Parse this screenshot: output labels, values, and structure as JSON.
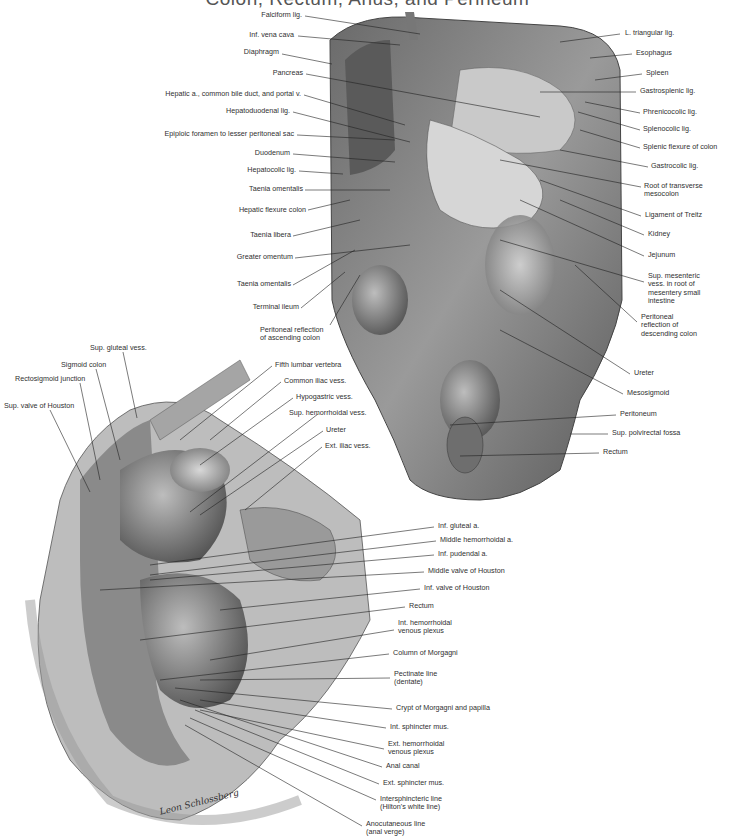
{
  "title": "Colon, Rectum, Anus, and Perineum",
  "upper_figure": {
    "left_labels": [
      {
        "text": "Falciform lig.",
        "x": 255,
        "y": 13
      },
      {
        "text": "Inf. vena cava",
        "x": 245,
        "y": 33
      },
      {
        "text": "Diaphragm",
        "x": 240,
        "y": 50
      },
      {
        "text": "Pancreas",
        "x": 274,
        "y": 71
      },
      {
        "text": "Hepatic a., common bile duct, and portal v.",
        "x": 298,
        "y": 92
      },
      {
        "text": "Hepatoduodenal lig.",
        "x": 290,
        "y": 109
      },
      {
        "text": "Epiploic foramen to lesser peritoneal sac",
        "x": 292,
        "y": 132
      },
      {
        "text": "Duodenum",
        "x": 288,
        "y": 151
      },
      {
        "text": "Hepatocolic lig.",
        "x": 294,
        "y": 168
      },
      {
        "text": "Taenia omentalis",
        "x": 302,
        "y": 187
      },
      {
        "text": "Hepatic flexure colon",
        "x": 305,
        "y": 208
      },
      {
        "text": "Taenia libera",
        "x": 290,
        "y": 233
      },
      {
        "text": "Greater omentum",
        "x": 292,
        "y": 255
      },
      {
        "text": "Taenia omentalis",
        "x": 290,
        "y": 282
      },
      {
        "text": "Terminal ileum",
        "x": 298,
        "y": 305
      }
    ],
    "left_multiline": {
      "lines": [
        "Peritoneal reflection",
        "of ascending colon"
      ],
      "x": 260,
      "y": 327
    },
    "right_labels": [
      {
        "text": "L. triangular lig.",
        "x": 625,
        "y": 31
      },
      {
        "text": "Esophagus",
        "x": 636,
        "y": 51
      },
      {
        "text": "Spleen",
        "x": 646,
        "y": 71
      },
      {
        "text": "Gastrosplenic lig.",
        "x": 640,
        "y": 89
      },
      {
        "text": "Phrenicocolic lig.",
        "x": 643,
        "y": 110
      },
      {
        "text": "Splenocolic lig.",
        "x": 643,
        "y": 127
      },
      {
        "text": "Splenic flexure of colon",
        "x": 643,
        "y": 145
      },
      {
        "text": "Gastrocolic lig.",
        "x": 651,
        "y": 164
      },
      {
        "text": "Ligament of Treitz",
        "x": 645,
        "y": 213
      },
      {
        "text": "Kidney",
        "x": 648,
        "y": 232
      },
      {
        "text": "Jejunum",
        "x": 648,
        "y": 253
      },
      {
        "text": "Ureter",
        "x": 634,
        "y": 371
      },
      {
        "text": "Mesosigmoid",
        "x": 627,
        "y": 391
      },
      {
        "text": "Peritoneum",
        "x": 620,
        "y": 412
      },
      {
        "text": "Sup. polvirectal fossa",
        "x": 612,
        "y": 431
      },
      {
        "text": "Rectum",
        "x": 603,
        "y": 450
      }
    ],
    "right_multiline": [
      {
        "lines": [
          "Root of transverse",
          "mesocolon"
        ],
        "x": 644,
        "y": 184
      },
      {
        "lines": [
          "Sup. mesenteric",
          "vess. in root of",
          "mesentery small",
          "intestine"
        ],
        "x": 648,
        "y": 274
      },
      {
        "lines": [
          "Peritoneal",
          "reflection of",
          "descending colon"
        ],
        "x": 641,
        "y": 315
      }
    ]
  },
  "lower_figure": {
    "top_labels": [
      {
        "text": "Sup. gluteal vess.",
        "x": 90,
        "y": 346
      },
      {
        "text": "Sigmoid colon",
        "x": 61,
        "y": 363
      },
      {
        "text": "Rectosigmoid junction",
        "x": 15,
        "y": 377
      },
      {
        "text": "Sup. valve of Houston",
        "x": 4,
        "y": 404
      },
      {
        "text": "Fifth lumbar vertebra",
        "x": 275,
        "y": 363
      },
      {
        "text": "Common iliac vess.",
        "x": 284,
        "y": 379
      },
      {
        "text": "Hypogastric vess.",
        "x": 296,
        "y": 395
      },
      {
        "text": "Sup. hemorrhoidal vess.",
        "x": 289,
        "y": 411
      },
      {
        "text": "Ureter",
        "x": 326,
        "y": 428
      },
      {
        "text": "Ext. iliac vess.",
        "x": 325,
        "y": 444
      }
    ],
    "right_labels": [
      {
        "text": "Inf. gluteal a.",
        "x": 438,
        "y": 524
      },
      {
        "text": "Middle hemorrhoidal a.",
        "x": 440,
        "y": 538
      },
      {
        "text": "Inf. pudendal a.",
        "x": 438,
        "y": 552
      },
      {
        "text": "Middle valve of Houston",
        "x": 428,
        "y": 569
      },
      {
        "text": "Inf. valve of Houston",
        "x": 424,
        "y": 586
      },
      {
        "text": "Rectum",
        "x": 409,
        "y": 604
      },
      {
        "text": "Column of Morgagni",
        "x": 393,
        "y": 651
      },
      {
        "text": "Crypt of Morgagni and papilla",
        "x": 396,
        "y": 706
      },
      {
        "text": "Int. sphincter mus.",
        "x": 390,
        "y": 725
      },
      {
        "text": "Anal canal",
        "x": 386,
        "y": 764
      },
      {
        "text": "Ext. sphincter mus.",
        "x": 383,
        "y": 781
      }
    ],
    "right_multiline": [
      {
        "lines": [
          "Int. hemorrhoidal",
          "venous plexus"
        ],
        "x": 398,
        "y": 621
      },
      {
        "lines": [
          "Pectinate line",
          "(dentate)"
        ],
        "x": 394,
        "y": 672
      },
      {
        "lines": [
          "Ext. hemorrhoidal",
          "venous plexus"
        ],
        "x": 388,
        "y": 742
      },
      {
        "lines": [
          "Intersphincteric line",
          "(Hilton's white line)"
        ],
        "x": 380,
        "y": 797
      },
      {
        "lines": [
          "Anocutaneous line",
          "(anal verge)"
        ],
        "x": 366,
        "y": 822
      }
    ]
  },
  "signature": "Leon Schlossberg"
}
